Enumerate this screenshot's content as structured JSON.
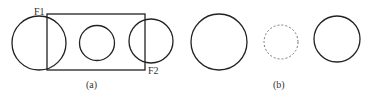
{
  "panels": {
    "a": {
      "caption": "(a)",
      "labels": {
        "f1": "F1",
        "f2": "F2"
      }
    },
    "b": {
      "caption": "(b)"
    }
  }
}
